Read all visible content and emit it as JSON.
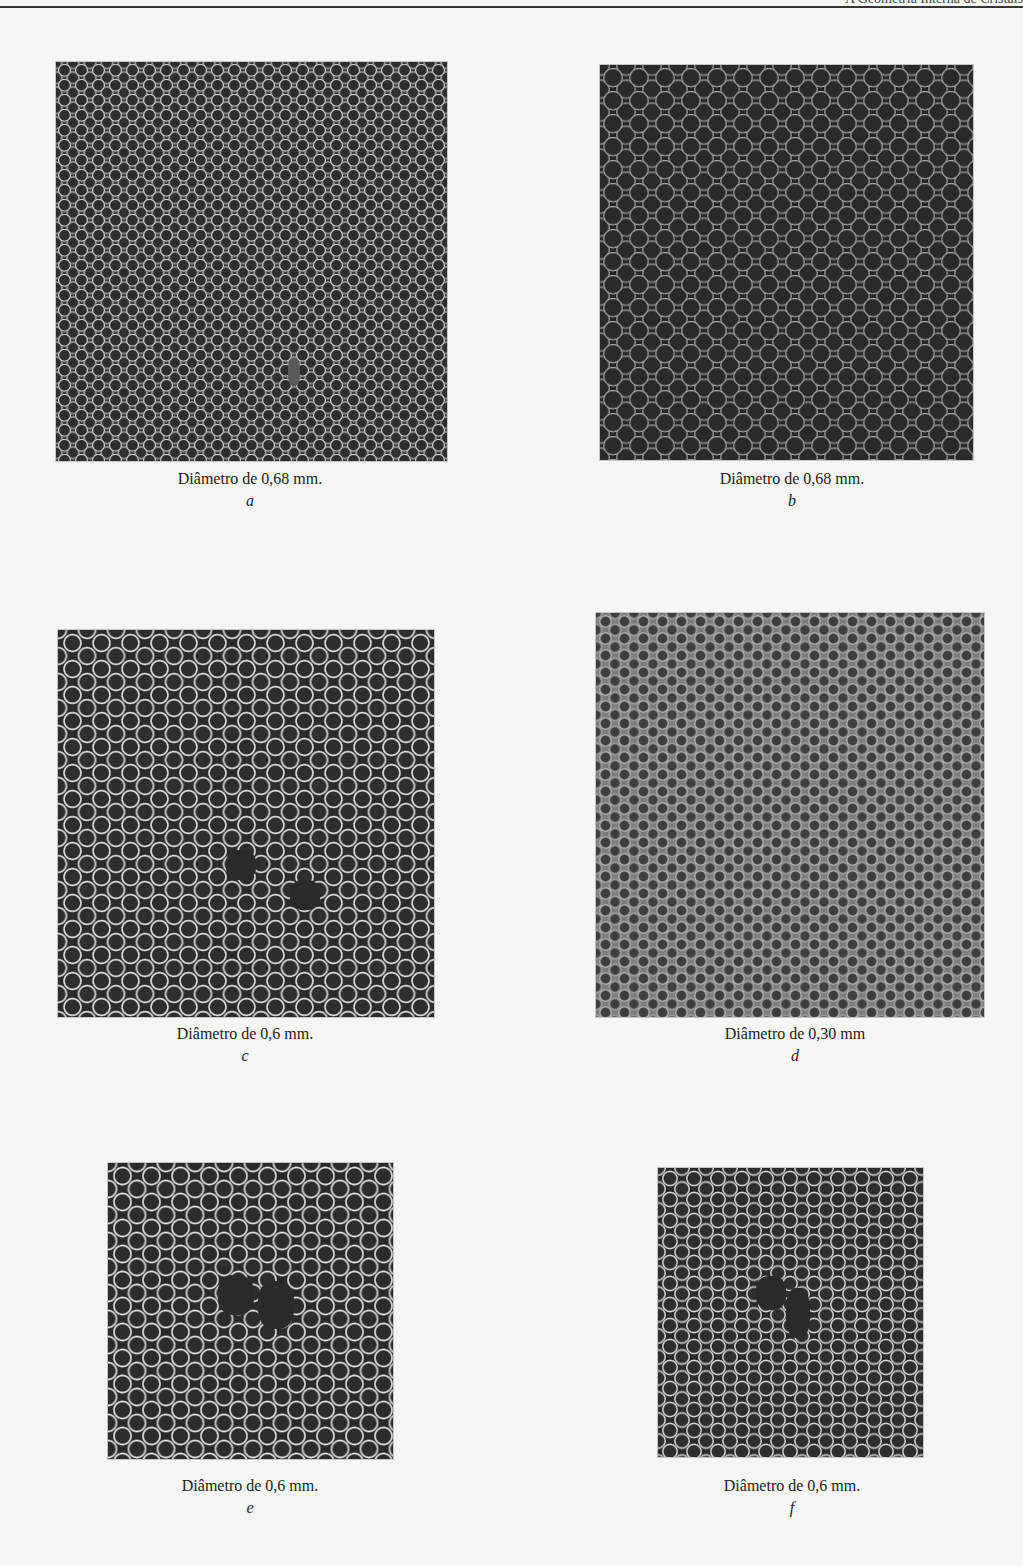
{
  "header": {
    "running_title": "A Geometria Interna de Cristais"
  },
  "figures": [
    {
      "id": "a",
      "caption": "Diâmetro de 0,68 mm.",
      "letter": "a",
      "image_description": "bubble raft, small bubbles in hexagonal close packing, medium gray"
    },
    {
      "id": "b",
      "caption": "Diâmetro de 0,68 mm.",
      "letter": "b",
      "image_description": "bubble raft, dark background, highlighted bubble edges"
    },
    {
      "id": "c",
      "caption": "Diâmetro de 0,6 mm.",
      "letter": "c",
      "image_description": "bubble raft with bright rings and lattice defects (vacancies)"
    },
    {
      "id": "d",
      "caption": "Diâmetro de 0,30 mm",
      "letter": "d",
      "image_description": "bubble raft, small bubbles, light gray, grain boundaries"
    },
    {
      "id": "e",
      "caption": "Diâmetro de 0,6 mm.",
      "letter": "e",
      "image_description": "bubble raft with central vacancy cluster"
    },
    {
      "id": "f",
      "caption": "Diâmetro de 0,6 mm.",
      "letter": "f",
      "image_description": "bubble raft with dislocation defect near center"
    }
  ]
}
